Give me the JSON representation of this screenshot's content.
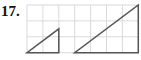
{
  "problem": {
    "number": "17.",
    "grid": {
      "origin_x": 27,
      "origin_y": 5,
      "cell": 15.9,
      "cols": 7,
      "rows": 3,
      "color": "#d9d9d9"
    },
    "figures": [
      {
        "name": "small-triangle",
        "points": [
          [
            0,
            3
          ],
          [
            2,
            3
          ],
          [
            2,
            1.5
          ]
        ],
        "color": "#555555"
      },
      {
        "name": "large-triangle",
        "points": [
          [
            3,
            3
          ],
          [
            7,
            3
          ],
          [
            7,
            0
          ]
        ],
        "color": "#555555"
      }
    ]
  }
}
